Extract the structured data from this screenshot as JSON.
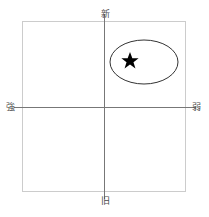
{
  "diagram": {
    "type": "positioning-matrix",
    "background_color": "#ffffff",
    "frame": {
      "name": "plot-frame",
      "x": 22,
      "y": 21,
      "width": 164,
      "height": 171,
      "stroke_color": "#cccccc",
      "stroke_width": 1
    },
    "axes": {
      "stroke_color": "#777777",
      "stroke_width": 1,
      "origin_x": 104,
      "origin_y": 107,
      "vertical": {
        "x": 104,
        "y1": 14,
        "y2": 199
      },
      "horizontal": {
        "y": 107,
        "x1": 14,
        "x2": 196
      }
    },
    "labels": {
      "top": "新",
      "bottom": "旧",
      "left": "強",
      "right": "弱",
      "color": "#4a4a4a"
    },
    "shapes": {
      "ellipse": {
        "name": "cluster-ellipse",
        "cx": 144,
        "cy": 62,
        "rx": 34,
        "ry": 22,
        "stroke_color": "#333333",
        "stroke_width": 1,
        "fill": "none"
      },
      "star": {
        "name": "position-star-marker",
        "cx": 130,
        "cy": 60,
        "size": 8,
        "fill_color": "#000000",
        "points": 5
      }
    }
  }
}
